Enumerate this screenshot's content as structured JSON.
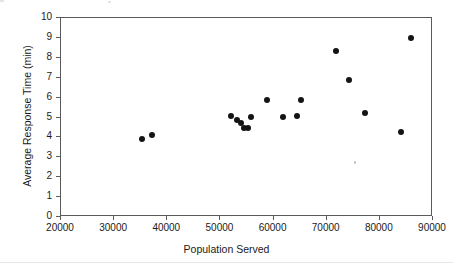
{
  "chart_data": {
    "type": "scatter",
    "title": "",
    "xlabel": "Population Served",
    "ylabel": "Average Response Time (min)",
    "xlim": [
      20000,
      90000
    ],
    "ylim": [
      0,
      10
    ],
    "xticks": [
      20000,
      30000,
      40000,
      50000,
      60000,
      70000,
      80000,
      90000
    ],
    "yticks": [
      0,
      1,
      2,
      3,
      4,
      5,
      6,
      7,
      8,
      9,
      10
    ],
    "xticklabels": [
      "20000",
      "30000",
      "40000",
      "50000",
      "60000",
      "70000",
      "80000",
      "90000"
    ],
    "yticklabels": [
      "0",
      "1",
      "2",
      "3",
      "4",
      "5",
      "6",
      "7",
      "8",
      "9",
      "10"
    ],
    "grid": false,
    "legend": false,
    "marker_color": "#141414",
    "marker_shape": "circle",
    "axis_color": "#5a5a5a",
    "x": [
      35500,
      37400,
      52100,
      53400,
      54000,
      54700,
      55400,
      55900,
      58900,
      61900,
      64600,
      65400,
      71900,
      74400,
      77400,
      84200,
      86000
    ],
    "y": [
      3.85,
      4.05,
      5.05,
      4.8,
      4.65,
      4.4,
      4.4,
      4.95,
      5.85,
      4.95,
      5.05,
      5.85,
      8.3,
      6.85,
      5.2,
      4.2,
      8.95
    ],
    "points": [
      {
        "x": 35500,
        "y": 3.85
      },
      {
        "x": 37400,
        "y": 4.05
      },
      {
        "x": 52100,
        "y": 5.05
      },
      {
        "x": 53400,
        "y": 4.8
      },
      {
        "x": 54000,
        "y": 4.65
      },
      {
        "x": 54700,
        "y": 4.4
      },
      {
        "x": 55400,
        "y": 4.4
      },
      {
        "x": 55900,
        "y": 4.95
      },
      {
        "x": 58900,
        "y": 5.85
      },
      {
        "x": 61900,
        "y": 4.95
      },
      {
        "x": 64600,
        "y": 5.05
      },
      {
        "x": 65400,
        "y": 5.85
      },
      {
        "x": 71900,
        "y": 8.3
      },
      {
        "x": 74400,
        "y": 6.85
      },
      {
        "x": 77400,
        "y": 5.2
      },
      {
        "x": 84200,
        "y": 4.2
      },
      {
        "x": 86000,
        "y": 8.95
      }
    ]
  }
}
